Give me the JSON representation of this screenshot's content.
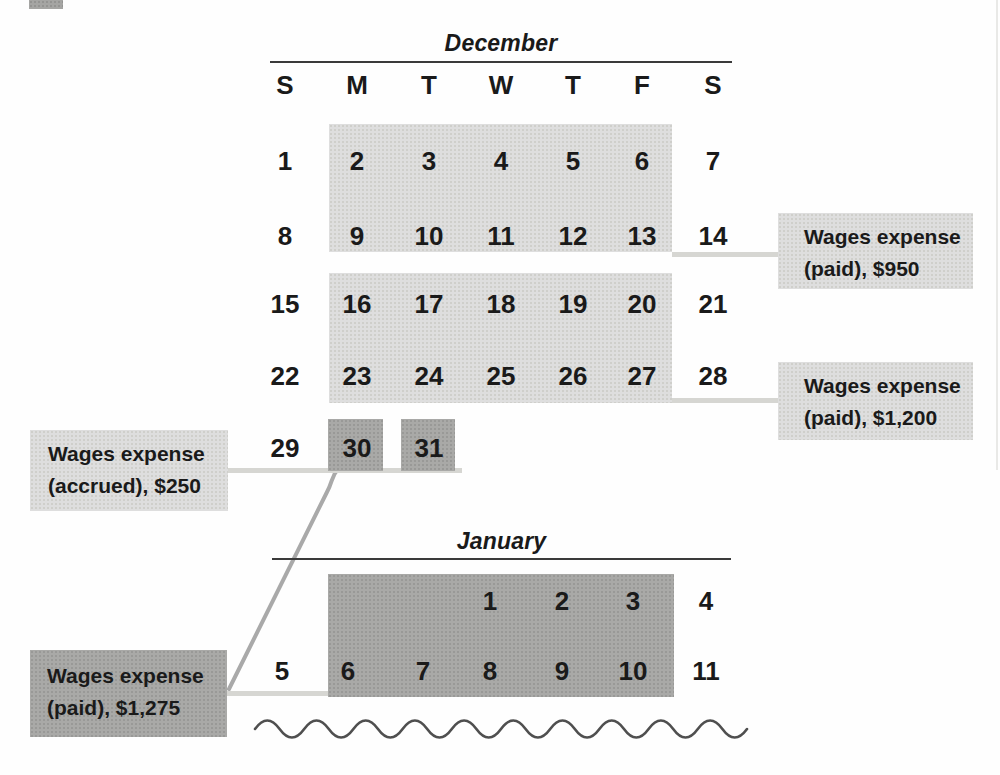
{
  "figure": {
    "description_hidden": false,
    "colors": {
      "light_fill": "#dedede",
      "dark_fill": "#a9a9a7",
      "connector_light": "#d6d6d2",
      "connector_diagonal": "#a9a9a9",
      "rule": "#3a3a3a",
      "text": "#1a1a1a",
      "wave": "#4f4f4f"
    }
  },
  "december": {
    "title": "December",
    "day_headers": [
      "S",
      "M",
      "T",
      "W",
      "T",
      "F",
      "S"
    ],
    "weeks": [
      [
        "1",
        "2",
        "3",
        "4",
        "5",
        "6",
        "7"
      ],
      [
        "8",
        "9",
        "10",
        "11",
        "12",
        "13",
        "14"
      ],
      [
        "15",
        "16",
        "17",
        "18",
        "19",
        "20",
        "21"
      ],
      [
        "22",
        "23",
        "24",
        "25",
        "26",
        "27",
        "28"
      ],
      [
        "29",
        "30",
        "31",
        "",
        "",
        "",
        ""
      ]
    ],
    "light_highlighted_days": "2-6, 9-13, 16-20, 23-27",
    "dark_highlighted_days": "30, 31"
  },
  "january": {
    "title": "January",
    "weeks": [
      [
        "",
        "",
        "",
        "1",
        "2",
        "3",
        "4"
      ],
      [
        "5",
        "6",
        "7",
        "8",
        "9",
        "10",
        "11"
      ]
    ],
    "dark_highlighted_days": "1-3, 6-10"
  },
  "annotations": {
    "paid_950": {
      "lines": [
        "Wages expense",
        "(paid), $950"
      ]
    },
    "paid_1200": {
      "lines": [
        "Wages expense",
        "(paid), $1,200"
      ]
    },
    "accrued_250": {
      "lines": [
        "Wages expense",
        "(accrued), $250"
      ]
    },
    "paid_1275": {
      "lines": [
        "Wages expense",
        "(paid), $1,275"
      ]
    }
  }
}
